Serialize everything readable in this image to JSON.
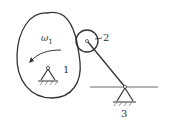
{
  "diagram": {
    "type": "cam-mechanism",
    "labels": {
      "angular_velocity": "ω",
      "angular_velocity_sub": "1",
      "cam": "1",
      "roller": "2",
      "ground_pivot": "3"
    },
    "colors": {
      "stroke": "#333333",
      "background": "#ffffff"
    }
  }
}
